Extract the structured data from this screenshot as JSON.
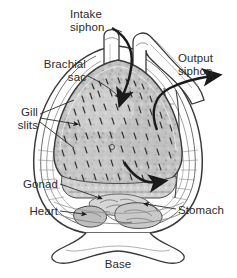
{
  "figure": {
    "background_color": "#ffffff",
    "ink_color": "#2b2b2b",
    "fill_gray": "#b9b9b9",
    "shade_gray": "#d2d2d2"
  },
  "labels": [
    {
      "id": "intake-siphon",
      "text": "Intake\nsiphon",
      "x": 70,
      "y": 8,
      "align": "left"
    },
    {
      "id": "output-siphon",
      "text": "Output\nsiphon",
      "x": 178,
      "y": 52,
      "align": "left"
    },
    {
      "id": "brachial-sac",
      "text": "Brachial\nsac",
      "x": 86,
      "y": 58,
      "align": "right"
    },
    {
      "id": "gill-slits",
      "text": "Gill\nslits",
      "x": 38,
      "y": 106,
      "align": "right"
    },
    {
      "id": "gonad",
      "text": "Gonad",
      "x": 58,
      "y": 178,
      "align": "right"
    },
    {
      "id": "heart",
      "text": "Heart",
      "x": 58,
      "y": 205,
      "align": "right"
    },
    {
      "id": "stomach",
      "text": "Stomach",
      "x": 178,
      "y": 204,
      "align": "left"
    },
    {
      "id": "base",
      "text": "Base",
      "x": 118,
      "y": 258,
      "align": "center"
    }
  ],
  "structures": [
    "intake-siphon",
    "output-siphon",
    "branchial-sac",
    "gill-slits",
    "gonad",
    "heart",
    "stomach",
    "base",
    "tunic-body-wall"
  ],
  "flow_arrows": [
    {
      "id": "intake-flow-arrow",
      "direction": "down-into-branchial-sac"
    },
    {
      "id": "output-flow-arrow",
      "direction": "up-and-right-out-of-output-siphon"
    },
    {
      "id": "internal-flow-arrow",
      "direction": "curving-right-across-atrium"
    }
  ]
}
